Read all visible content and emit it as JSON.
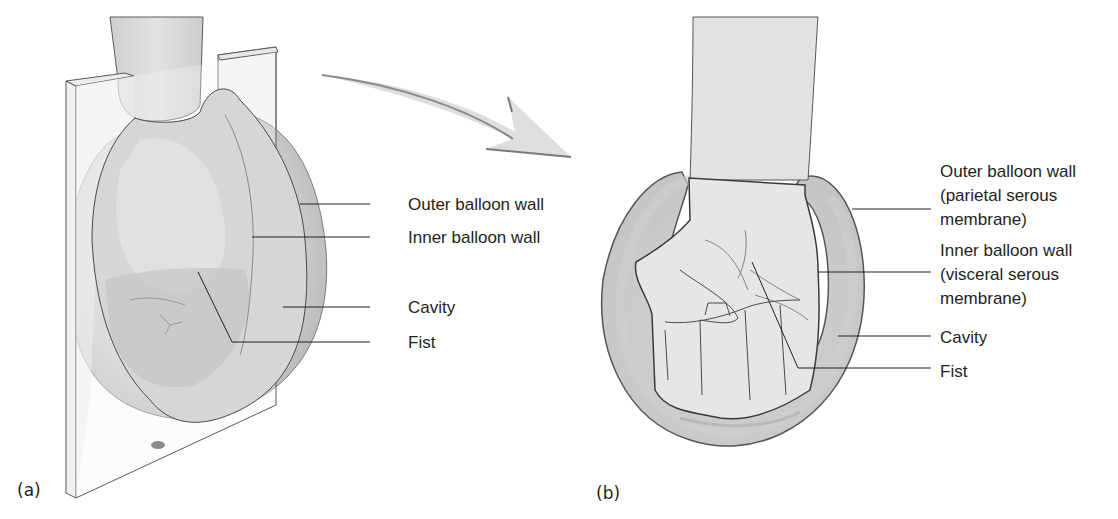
{
  "figure": {
    "panel_a": {
      "tag": "(a)",
      "labels": {
        "outer_wall": "Outer balloon wall",
        "inner_wall": "Inner balloon wall",
        "cavity": "Cavity",
        "fist": "Fist"
      }
    },
    "panel_b": {
      "tag": "(b)",
      "labels": {
        "outer_wall_line1": "Outer balloon wall",
        "outer_wall_line2": "(parietal serous",
        "outer_wall_line3": "membrane)",
        "inner_wall_line1": "Inner balloon wall",
        "inner_wall_line2": "(visceral serous",
        "inner_wall_line3": "membrane)",
        "cavity": "Cavity",
        "fist": "Fist"
      }
    },
    "icons": [
      "curved-arrow-icon"
    ],
    "colors": {
      "balloon_fill": "#c9c9c9",
      "balloon_light": "#dedede",
      "stroke": "#4a4a4a",
      "leader_line": "#231f20",
      "text": "#231f20",
      "background": "#ffffff"
    }
  }
}
